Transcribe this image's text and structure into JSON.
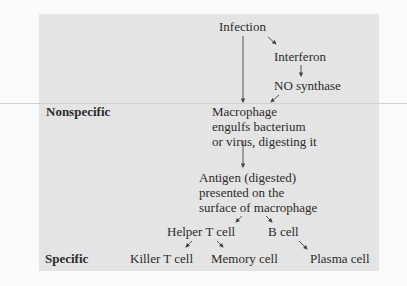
{
  "diagram": {
    "colors": {
      "panel": "#e4e4e4",
      "background": "#fafafa",
      "text": "#2b2b2b",
      "arrow": "#444444"
    },
    "row_labels": {
      "nonspecific": "Nonspecific",
      "specific": "Specific"
    },
    "nodes": {
      "infection": "Infection",
      "interferon": "Interferon",
      "no_synthase": "NO synthase",
      "macrophage": [
        "Macrophage",
        "engulfs bacterium",
        "or virus, digesting it"
      ],
      "antigen": [
        "Antigen (digested)",
        "presented on the",
        "surface of macrophage"
      ],
      "helper_t": "Helper T cell",
      "b_cell": "B cell",
      "killer_t": "Killer T cell",
      "memory": "Memory cell",
      "plasma": "Plasma cell"
    },
    "edges": [
      [
        "Infection",
        "Interferon"
      ],
      [
        "Interferon",
        "NO synthase"
      ],
      [
        "NO synthase",
        "Macrophage"
      ],
      [
        "Infection",
        "Macrophage"
      ],
      [
        "Macrophage",
        "Antigen (digested)"
      ],
      [
        "Antigen (digested)",
        "Helper T cell"
      ],
      [
        "Antigen (digested)",
        "B cell"
      ],
      [
        "Helper T cell",
        "Killer T cell"
      ],
      [
        "Helper T cell",
        "Memory cell"
      ],
      [
        "B cell",
        "Plasma cell"
      ]
    ]
  }
}
